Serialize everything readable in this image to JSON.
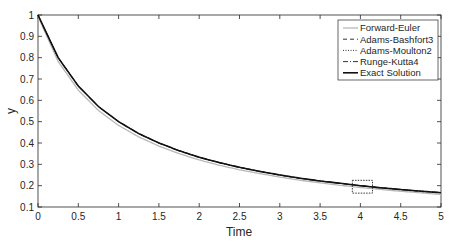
{
  "chart_data": {
    "type": "line",
    "title": "",
    "xlabel": "Time",
    "ylabel": "y",
    "xlim": [
      0,
      5
    ],
    "ylim": [
      0.1,
      1
    ],
    "xticks": [
      0,
      0.5,
      1,
      1.5,
      2,
      2.5,
      3,
      3.5,
      4,
      4.5,
      5
    ],
    "xtick_labels": [
      "0",
      "0.5",
      "1",
      "1.5",
      "2",
      "2.5",
      "3",
      "3.5",
      "4",
      "4.5",
      "5"
    ],
    "yticks": [
      0.1,
      0.2,
      0.3,
      0.4,
      0.5,
      0.6,
      0.7,
      0.8,
      0.9,
      1
    ],
    "ytick_labels": [
      "0.1",
      "0.2",
      "0.3",
      "0.4",
      "0.5",
      "0.6",
      "0.7",
      "0.8",
      "0.9",
      "1"
    ],
    "grid": false,
    "legend_position": "upper right",
    "x": [
      0,
      0.25,
      0.5,
      0.75,
      1,
      1.25,
      1.5,
      1.75,
      2,
      2.25,
      2.5,
      2.75,
      3,
      3.25,
      3.5,
      3.75,
      4,
      4.25,
      4.5,
      4.75,
      5
    ],
    "series": [
      {
        "name": "Forward-Euler",
        "style": "solid-light",
        "color": "#b0b0b0",
        "values": [
          1,
          0.79,
          0.655,
          0.56,
          0.49,
          0.436,
          0.393,
          0.358,
          0.328,
          0.303,
          0.282,
          0.264,
          0.248,
          0.233,
          0.221,
          0.209,
          0.199,
          0.19,
          0.181,
          0.174,
          0.166
        ]
      },
      {
        "name": "Adams-Bashfort3",
        "style": "dashed",
        "color": "#333333",
        "values": [
          1,
          0.8,
          0.667,
          0.571,
          0.5,
          0.444,
          0.4,
          0.364,
          0.333,
          0.308,
          0.286,
          0.267,
          0.25,
          0.235,
          0.222,
          0.211,
          0.2,
          0.19,
          0.182,
          0.174,
          0.167
        ]
      },
      {
        "name": "Adams-Moulton2",
        "style": "dotted",
        "color": "#333333",
        "values": [
          1,
          0.8,
          0.667,
          0.571,
          0.5,
          0.444,
          0.4,
          0.364,
          0.333,
          0.308,
          0.286,
          0.267,
          0.25,
          0.235,
          0.222,
          0.211,
          0.2,
          0.19,
          0.182,
          0.174,
          0.167
        ]
      },
      {
        "name": "Runge-Kutta4",
        "style": "dashdot",
        "color": "#333333",
        "values": [
          1,
          0.8,
          0.667,
          0.571,
          0.5,
          0.444,
          0.4,
          0.364,
          0.333,
          0.308,
          0.286,
          0.267,
          0.25,
          0.235,
          0.222,
          0.211,
          0.2,
          0.19,
          0.182,
          0.174,
          0.167
        ]
      },
      {
        "name": "Exact Solution",
        "style": "solid",
        "color": "#111111",
        "values": [
          1,
          0.8,
          0.667,
          0.571,
          0.5,
          0.444,
          0.4,
          0.364,
          0.333,
          0.308,
          0.286,
          0.267,
          0.25,
          0.235,
          0.222,
          0.211,
          0.2,
          0.19,
          0.182,
          0.174,
          0.167
        ]
      }
    ],
    "annotations": [
      {
        "type": "dashed-rectangle",
        "x_range": [
          3.9,
          4.15
        ],
        "y_range": [
          0.165,
          0.225
        ],
        "note": "zoom region marker"
      }
    ]
  },
  "legend": {
    "items": [
      {
        "label": "Forward-Euler"
      },
      {
        "label": "Adams-Bashfort3"
      },
      {
        "label": "Adams-Moulton2"
      },
      {
        "label": "Runge-Kutta4"
      },
      {
        "label": "Exact Solution"
      }
    ]
  }
}
